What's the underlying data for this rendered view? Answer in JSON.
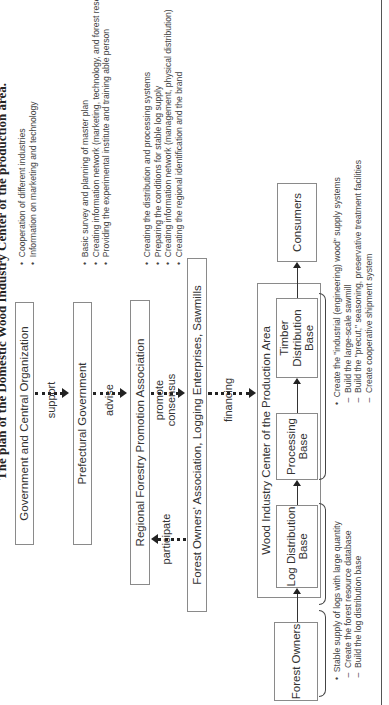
{
  "title": "The plan of the Domestic Wood Industry Center of the production area.",
  "boxes": {
    "government": "Government and Central Organization",
    "prefectural": "Prefectural Government",
    "regional": "Regional Forestry Promotion Association",
    "forest_assoc": "Forest Owners' Association, Logging Enterprises, Sawmills",
    "wood_center": "Wood Industry Center of the Production Area",
    "log_base": "Log Distribution Base",
    "processing_base": "Processing Base",
    "timber_base": "Timber Distribution Base",
    "forest_owners": "Forest Owners",
    "consumers": "Consumers"
  },
  "arrows": {
    "support": "support",
    "advise": "advise",
    "promote": "promote",
    "consensus": "consensus",
    "participate": "participate",
    "financing": "financing"
  },
  "notes": {
    "government": [
      "Cooperation of different industries",
      "Information on marketing and technology"
    ],
    "prefectural": [
      "Basic survey and planning of master plan",
      "Creating information network (marketing, technology, and forest resources)",
      "Providing the experimental institute and training able person"
    ],
    "regional": [
      "Creating the distribution and processing systems",
      "Preparing the conditions for stable log supply",
      "Creating information network (management, physical distribution)",
      "Creating the regional identification and the brand"
    ],
    "supply": {
      "main": "Stable supply of logs with large quantity",
      "subs": [
        "Create the forest resource database",
        "Build the log distribution base"
      ]
    },
    "industrial": {
      "main": "Create the \"industrial (engineering) wood\" supply systems",
      "subs": [
        "Build the large-scale sawmill",
        "Build the \"precut,\" seasoning, preservative treatment facilities",
        "Create cooperative shipment system"
      ]
    }
  },
  "glyphs": {
    "bullet": "•",
    "dash": "–"
  }
}
